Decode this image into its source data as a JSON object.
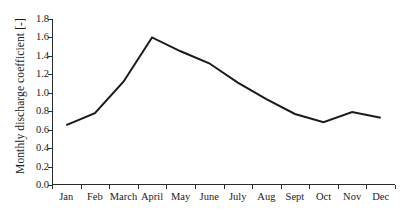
{
  "chart_data": {
    "type": "line",
    "title": "",
    "xlabel": "",
    "ylabel": "Monthly discharge coefficient [-]",
    "categories": [
      "Jan",
      "Feb",
      "March",
      "April",
      "May",
      "June",
      "July",
      "Aug",
      "Sept",
      "Oct",
      "Nov",
      "Dec"
    ],
    "series": [
      {
        "name": "Monthly discharge coefficient",
        "values": [
          0.65,
          0.78,
          1.12,
          1.6,
          1.45,
          1.32,
          1.11,
          0.93,
          0.77,
          0.68,
          0.79,
          0.73
        ],
        "color": "#1a1a1a"
      }
    ],
    "ylim": [
      0.0,
      1.8
    ],
    "ytick_labels": [
      "0.0",
      "0.2",
      "0.4",
      "0.6",
      "0.8",
      "1.0",
      "1.2",
      "1.4",
      "1.6",
      "1.8"
    ],
    "ytick_values": [
      0.0,
      0.2,
      0.4,
      0.6,
      0.8,
      1.0,
      1.2,
      1.4,
      1.6,
      1.8
    ],
    "grid": false,
    "legend": false,
    "legend_position": "none",
    "markers": false,
    "background_color": "#ffffff",
    "axis_color": "#2b2b2b"
  }
}
